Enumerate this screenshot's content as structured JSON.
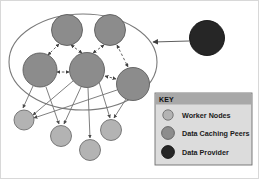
{
  "figure": {
    "name": "data-caching-peer-network-diagram",
    "background": "#ffffff",
    "width": 259,
    "height": 179,
    "outer_border_color": "#c9c9c9"
  },
  "colors": {
    "worker_node_fill": "#b3b3b3",
    "worker_node_stroke": "#6e6e6e",
    "peer_node_fill": "#8c8c8c",
    "peer_node_stroke": "#5a5a5a",
    "provider_node_fill": "#262626",
    "provider_node_stroke": "#111111",
    "ellipse_stroke": "#7a7a7a",
    "solid_edge": "#707070",
    "dashed_edge": "#707070",
    "provider_edge": "#5f5f5f",
    "legend_background": "#dcdcdc",
    "legend_header": "#a8a8a8",
    "legend_border": "#6e6e6e",
    "legend_text": "#1a1a1a"
  },
  "legend": {
    "title": "KEY",
    "items": [
      {
        "label": "Worker Nodes",
        "swatch": "worker-node-swatch",
        "color": "#b3b3b3",
        "radius": 5.2
      },
      {
        "label": "Data Caching Peers",
        "swatch": "data-caching-peer-swatch",
        "color": "#8c8c8c",
        "radius": 6.4
      },
      {
        "label": "Data Provider",
        "swatch": "data-provider-swatch",
        "color": "#262626",
        "radius": 6.4
      }
    ],
    "box": {
      "x": 155,
      "y": 93,
      "width": 97,
      "height": 72
    },
    "header": {
      "x": 155,
      "y": 93,
      "width": 97,
      "height": 11
    }
  },
  "cluster_boundary": {
    "name": "peer-cluster-ellipse",
    "cx": 83,
    "cy": 62,
    "rx": 74,
    "ry": 48
  },
  "nodes": {
    "data_caching_peers": [
      {
        "id": "peer-top-left",
        "cx": 67,
        "cy": 30,
        "r": 15.5
      },
      {
        "id": "peer-top-right",
        "cx": 110,
        "cy": 30,
        "r": 15.5
      },
      {
        "id": "peer-mid-left",
        "cx": 40,
        "cy": 70,
        "r": 17.0
      },
      {
        "id": "peer-center",
        "cx": 87,
        "cy": 70,
        "r": 17.5
      },
      {
        "id": "peer-right",
        "cx": 133,
        "cy": 84,
        "r": 16.5
      }
    ],
    "worker_nodes": [
      {
        "id": "worker-left",
        "cx": 24,
        "cy": 120,
        "r": 10.0
      },
      {
        "id": "worker-mid-left",
        "cx": 61,
        "cy": 136,
        "r": 10.5
      },
      {
        "id": "worker-bottom",
        "cx": 90,
        "cy": 150,
        "r": 10.5
      },
      {
        "id": "worker-mid-right",
        "cx": 111,
        "cy": 130,
        "r": 10.5
      }
    ],
    "data_provider": {
      "id": "provider-node",
      "cx": 207,
      "cy": 38,
      "r": 17.5
    }
  },
  "edges": {
    "peer_to_peer_dashed": [
      {
        "from": "peer-top-left",
        "to": "peer-center",
        "bidirectional": true
      },
      {
        "from": "peer-top-left",
        "to": "peer-mid-left",
        "bidirectional": true
      },
      {
        "from": "peer-top-right",
        "to": "peer-center",
        "bidirectional": true
      },
      {
        "from": "peer-top-right",
        "to": "peer-right",
        "bidirectional": true
      },
      {
        "from": "peer-mid-left",
        "to": "peer-center",
        "bidirectional": true
      },
      {
        "from": "peer-center",
        "to": "peer-right",
        "bidirectional": true
      }
    ],
    "peer_to_worker_solid": [
      {
        "from": "peer-mid-left",
        "to": "worker-left"
      },
      {
        "from": "peer-mid-left",
        "to": "worker-mid-left"
      },
      {
        "from": "peer-center",
        "to": "worker-left"
      },
      {
        "from": "peer-center",
        "to": "worker-mid-left"
      },
      {
        "from": "peer-center",
        "to": "worker-bottom"
      },
      {
        "from": "peer-center",
        "to": "worker-mid-right"
      },
      {
        "from": "peer-right",
        "to": "worker-left"
      },
      {
        "from": "peer-right",
        "to": "worker-mid-right"
      }
    ],
    "provider_to_cluster": {
      "from": "provider-node",
      "to": "peer-cluster-ellipse",
      "x1": 189,
      "y1": 41,
      "x2": 152,
      "y2": 42
    }
  }
}
